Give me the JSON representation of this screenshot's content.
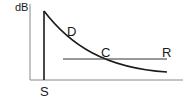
{
  "diagram": {
    "type": "sound-decay-diagram",
    "y_axis_label": "dB",
    "labels": {
      "source": "S",
      "decay_curve": "D",
      "crossing_point": "C",
      "reference_level": "R"
    },
    "colors": {
      "axis": "#777777",
      "lines": "#1a1a1a",
      "background": "#ffffff"
    }
  }
}
